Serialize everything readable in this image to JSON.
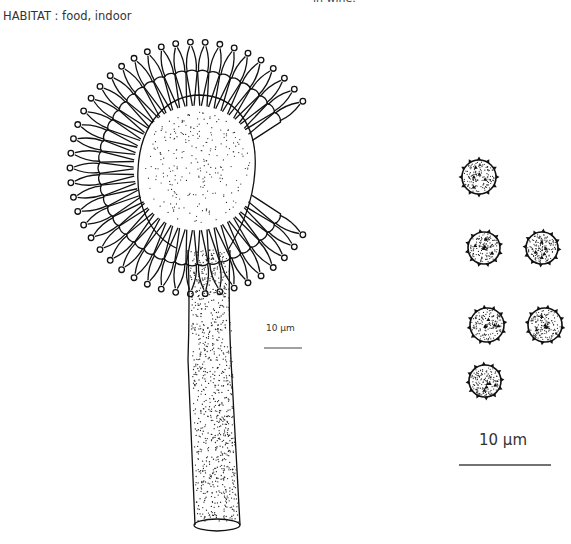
{
  "page": {
    "top_fragment": "in wine.",
    "habitat": "HABITAT : food, indoor"
  },
  "figure": {
    "scale_bar_conidiophore": {
      "label": "10 µm"
    },
    "scale_bar_spores": {
      "label": "10 µm"
    },
    "spores": [
      {
        "cx": 479,
        "cy": 177,
        "r": 17
      },
      {
        "cx": 484,
        "cy": 248,
        "r": 16
      },
      {
        "cx": 542,
        "cy": 248,
        "r": 16
      },
      {
        "cx": 487,
        "cy": 325,
        "r": 17
      },
      {
        "cx": 545,
        "cy": 325,
        "r": 17
      },
      {
        "cx": 485,
        "cy": 381,
        "r": 16
      }
    ]
  },
  "colors": {
    "ink": "#111111",
    "background": "#ffffff",
    "text": "#333333"
  }
}
